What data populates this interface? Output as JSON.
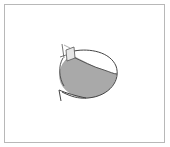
{
  "figure": {
    "caption": "",
    "colors": {
      "frame": "#b8b8b8",
      "outline": "#444444",
      "liquid": "#a9a9a9",
      "neck": "#e6e6e6",
      "background": "#ffffff"
    }
  }
}
